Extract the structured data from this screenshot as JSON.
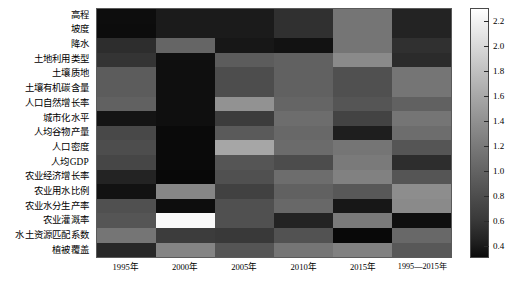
{
  "chart_data": {
    "type": "heatmap",
    "title": "",
    "xlabel": "",
    "ylabel": "",
    "colormap": "gray",
    "grid": false,
    "legend_position": "right",
    "colorbar": {
      "label": "",
      "vmin": 0.3,
      "vmax": 2.3,
      "ticks": [
        2.2,
        2.0,
        1.8,
        1.6,
        1.4,
        1.2,
        1.0,
        0.8,
        0.6,
        0.4
      ],
      "tick_labels": [
        "2.2",
        "2.0",
        "1.8",
        "1.6",
        "1.4",
        "1.2",
        "1.0",
        "0.8",
        "0.6",
        "0.4"
      ],
      "orientation": "vertical"
    },
    "x_categories": [
      "1995年",
      "2000年",
      "2005年",
      "2010年",
      "2015年",
      "1995—2015年"
    ],
    "y_categories": [
      "高程",
      "坡度",
      "降水",
      "土地利用类型",
      "土壤质地",
      "土壤有机碳含量",
      "人口自然增长率",
      "城市化水平",
      "人均谷物产量",
      "人口密度",
      "人均GDP",
      "农业经济增长率",
      "农业用水比例",
      "农业水分生产率",
      "农业灌溉率",
      "水土资源匹配系数",
      "植被覆盖"
    ],
    "values": [
      [
        0.34,
        0.45,
        0.45,
        0.62,
        1.18,
        0.52
      ],
      [
        0.33,
        0.45,
        0.45,
        0.62,
        1.18,
        0.52
      ],
      [
        0.6,
        1.05,
        0.42,
        0.38,
        1.18,
        0.62
      ],
      [
        0.66,
        0.36,
        0.98,
        1.02,
        1.35,
        0.58
      ],
      [
        0.98,
        0.36,
        0.86,
        1.02,
        0.88,
        1.18
      ],
      [
        0.98,
        0.36,
        0.86,
        1.02,
        0.88,
        1.18
      ],
      [
        1.02,
        0.36,
        1.42,
        1.05,
        0.92,
        1.02
      ],
      [
        0.4,
        0.36,
        0.72,
        1.12,
        0.78,
        1.18
      ],
      [
        0.82,
        0.32,
        0.96,
        1.08,
        0.48,
        1.12
      ],
      [
        0.86,
        0.32,
        1.58,
        1.1,
        1.18,
        0.92
      ],
      [
        0.8,
        0.32,
        0.92,
        0.85,
        1.22,
        0.6
      ],
      [
        0.52,
        0.3,
        0.88,
        1.12,
        1.28,
        0.92
      ],
      [
        0.38,
        1.32,
        0.76,
        1.02,
        0.95,
        1.38
      ],
      [
        0.88,
        0.34,
        0.88,
        1.08,
        0.42,
        1.35
      ],
      [
        0.92,
        2.25,
        0.88,
        0.52,
        1.22,
        0.36
      ],
      [
        1.18,
        0.72,
        0.7,
        0.9,
        0.3,
        1.08
      ],
      [
        0.55,
        1.3,
        0.92,
        1.18,
        1.28,
        0.95
      ],
      [
        0.55,
        1.3,
        0.82,
        0.34,
        0.98,
        1.05
      ]
    ]
  },
  "axes": {
    "y_labels": [
      "高程",
      "坡度",
      "降水",
      "土地利用类型",
      "土壤质地",
      "土壤有机碳含量",
      "人口自然增长率",
      "城市化水平",
      "人均谷物产量",
      "人口密度",
      "人均GDP",
      "农业经济增长率",
      "农业用水比例",
      "农业水分生产率",
      "农业灌溉率",
      "水土资源匹配系数",
      "植被覆盖"
    ],
    "x_labels": [
      "1995年",
      "2000年",
      "2005年",
      "2010年",
      "2015年",
      "1995—2015年"
    ]
  },
  "colorbar_ticks": [
    "2.2",
    "2.0",
    "1.8",
    "1.6",
    "1.4",
    "1.2",
    "1.0",
    "0.8",
    "0.6",
    "0.4"
  ]
}
